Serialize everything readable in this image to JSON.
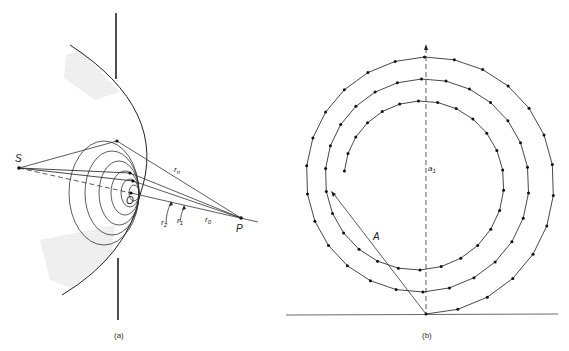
{
  "panel_a": {
    "caption": "(a)",
    "labels": {
      "S": "S",
      "O": "O",
      "P": "P",
      "rn": "r",
      "rn_sub": "n",
      "r2": "r",
      "r2_sub": "2",
      "r1": "r",
      "r1_sub": "1",
      "r0": "r",
      "r0_sub": "0"
    }
  },
  "panel_b": {
    "caption": "(b)",
    "labels": {
      "a1": "a",
      "a1_sub": "1",
      "A": "A"
    }
  },
  "colors": {
    "line": "#222222",
    "shade": "#d8d8d8",
    "background": "#ffffff"
  }
}
